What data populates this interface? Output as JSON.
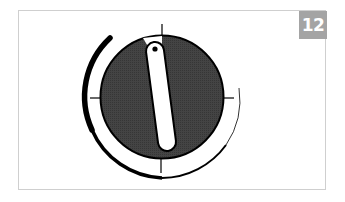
{
  "figure": {
    "step_number": "12",
    "badge_color": "#a4a4a4",
    "frame_border_color": "#cfcfcf",
    "dial": {
      "face_color": "#3d3d3d",
      "outline_color": "#000000",
      "pointer_color": "#ffffff",
      "ticks": [
        "top",
        "right",
        "bottom",
        "left"
      ],
      "rotation_arc_direction": "clockwise-from-upper-left"
    }
  }
}
